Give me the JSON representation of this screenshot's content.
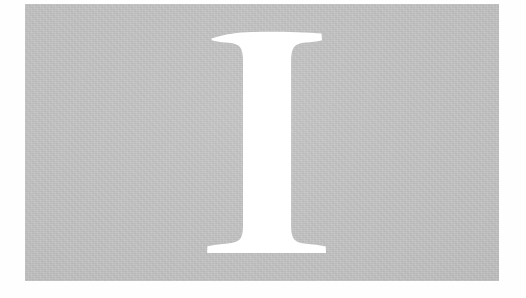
{
  "page": {
    "kind": "scanned-letterform-plate",
    "canvas_width": 526,
    "canvas_height": 298,
    "background_color": "#fefefe"
  },
  "plate": {
    "name": "gray-plate",
    "fill_color": "#c0c0c0",
    "left": 25,
    "top": 4,
    "width": 474,
    "height": 277,
    "texture": "paper-grain"
  },
  "letterform": {
    "character": "I",
    "style": "serif-slab-bracketed",
    "color": "#ffffff",
    "render_mode": "knockout",
    "center_x": 267,
    "cap_top": 32,
    "baseline": 253,
    "stem_left": 242,
    "stem_right": 292,
    "stem_width": 50,
    "top_serif_left": 211,
    "top_serif_right": 322,
    "bottom_serif_left": 207,
    "bottom_serif_right": 326
  }
}
